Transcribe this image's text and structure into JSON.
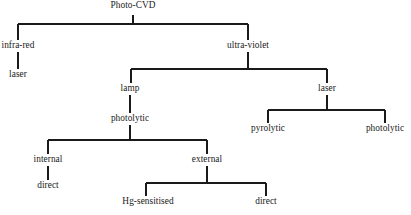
{
  "diagram": {
    "type": "tree",
    "background_color": "#ffffff",
    "line_color": "#1a1a1a",
    "text_color": "#1a1a1a",
    "nodes": [
      {
        "id": "photo-cvd",
        "label": "Photo-CVD",
        "x": 133,
        "y": 9,
        "level": 0
      },
      {
        "id": "infra-red",
        "label": "infra-red",
        "x": 18,
        "y": 47,
        "level": 1
      },
      {
        "id": "ultra-violet",
        "label": "ultra-violet",
        "x": 248,
        "y": 47,
        "level": 1
      },
      {
        "id": "ir-laser",
        "label": "laser",
        "x": 18,
        "y": 76,
        "level": 2
      },
      {
        "id": "uv-lamp",
        "label": "lamp",
        "x": 130,
        "y": 90,
        "level": 2
      },
      {
        "id": "uv-laser",
        "label": "laser",
        "x": 327,
        "y": 90,
        "level": 2
      },
      {
        "id": "lamp-photolytic",
        "label": "photolytic",
        "x": 130,
        "y": 120,
        "level": 3
      },
      {
        "id": "laser-pyrolytic",
        "label": "pyrolytic",
        "x": 268,
        "y": 130,
        "level": 3
      },
      {
        "id": "laser-photolytic",
        "label": "photolytic",
        "x": 385,
        "y": 130,
        "level": 3
      },
      {
        "id": "internal",
        "label": "internal",
        "x": 48,
        "y": 161,
        "level": 4
      },
      {
        "id": "external",
        "label": "external",
        "x": 207,
        "y": 161,
        "level": 4
      },
      {
        "id": "internal-direct",
        "label": "direct",
        "x": 48,
        "y": 187,
        "level": 5
      },
      {
        "id": "hg-sensitised",
        "label": "Hg-sensitised",
        "x": 148,
        "y": 203,
        "level": 5
      },
      {
        "id": "external-direct",
        "label": "direct",
        "x": 266,
        "y": 203,
        "level": 5
      }
    ],
    "edges": [
      {
        "from": "photo-cvd",
        "to": "infra-red",
        "kind": "elbow-left"
      },
      {
        "from": "photo-cvd",
        "to": "ultra-violet",
        "kind": "elbow-right"
      },
      {
        "from": "infra-red",
        "to": "ir-laser",
        "kind": "straight"
      },
      {
        "from": "ultra-violet",
        "to": "uv-lamp",
        "kind": "elbow-left"
      },
      {
        "from": "ultra-violet",
        "to": "uv-laser",
        "kind": "elbow-right"
      },
      {
        "from": "uv-lamp",
        "to": "lamp-photolytic",
        "kind": "straight"
      },
      {
        "from": "uv-laser",
        "to": "laser-pyrolytic",
        "kind": "elbow-left"
      },
      {
        "from": "uv-laser",
        "to": "laser-photolytic",
        "kind": "elbow-right"
      },
      {
        "from": "lamp-photolytic",
        "to": "internal",
        "kind": "elbow-left"
      },
      {
        "from": "lamp-photolytic",
        "to": "external",
        "kind": "elbow-right"
      },
      {
        "from": "internal",
        "to": "internal-direct",
        "kind": "straight"
      },
      {
        "from": "external",
        "to": "hg-sensitised",
        "kind": "elbow-left"
      },
      {
        "from": "external",
        "to": "external-direct",
        "kind": "elbow-right"
      }
    ]
  }
}
